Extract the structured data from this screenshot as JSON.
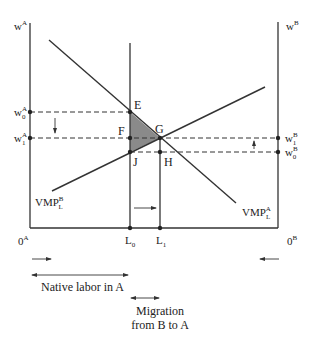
{
  "diagram": {
    "axes": {
      "left_axis_label": "w",
      "left_axis_sup": "A",
      "right_axis_label": "w",
      "right_axis_sup": "B",
      "origin_left": "0",
      "origin_left_sup": "A",
      "origin_right": "0",
      "origin_right_sup": "B"
    },
    "wage_labels": {
      "w0A": {
        "base": "w",
        "sup": "A",
        "sub": "0"
      },
      "w1A": {
        "base": "w",
        "sup": "A",
        "sub": "1"
      },
      "w1B": {
        "base": "w",
        "sup": "B",
        "sub": "1"
      },
      "w0B": {
        "base": "w",
        "sup": "B",
        "sub": "0"
      }
    },
    "points": {
      "E": "E",
      "F": "F",
      "G": "G",
      "J": "J",
      "H": "H"
    },
    "curves": {
      "vmp_a": {
        "base": "VMP",
        "sub": "L",
        "sup": "A"
      },
      "vmp_b": {
        "base": "VMP",
        "sub": "L",
        "sup": "B"
      }
    },
    "x_labels": {
      "L0": {
        "base": "L",
        "sub": "0"
      },
      "L1": {
        "base": "L",
        "sub": "1"
      }
    },
    "annotations": {
      "native_labor": "Native labor in A",
      "migration_line1": "Migration",
      "migration_line2": "from B to A"
    },
    "colors": {
      "ink": "#333333",
      "shaded_triangle": "#8a8a8a"
    }
  }
}
